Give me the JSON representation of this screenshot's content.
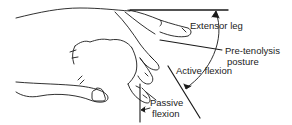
{
  "diagram": {
    "labels": {
      "extensor_leg": "Extensor leg",
      "pre_tenolysis_line1": "Pre-tenolysis",
      "pre_tenolysis_line2": "posture",
      "active_flexion": "Active flexion",
      "passive_line1": "Passive",
      "passive_line2": "flexion"
    },
    "colors": {
      "stroke": "#1a1a1a",
      "background": "#ffffff"
    }
  }
}
